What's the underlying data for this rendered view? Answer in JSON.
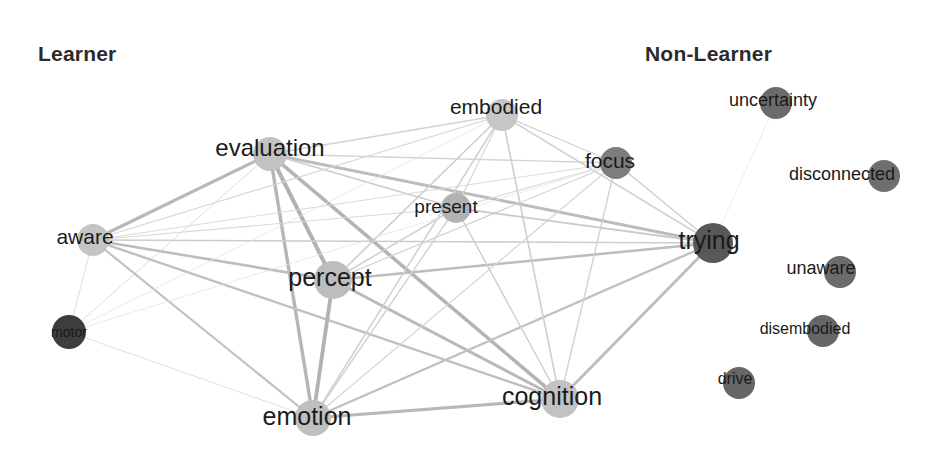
{
  "figure": {
    "type": "network-graph",
    "width": 936,
    "height": 454,
    "background": "#ffffff"
  },
  "groups": [
    {
      "id": "learner",
      "label": "Learner",
      "x": 38,
      "y": 42
    },
    {
      "id": "non-learner",
      "label": "Non-Learner",
      "x": 645,
      "y": 42
    }
  ],
  "colors": {
    "light_node": "#c9c9c9",
    "medium_node": "#a8a8a8",
    "dark_node": "#6e6e6e",
    "darkest_node": "#3d3d3d",
    "edge": "#b4b4b4",
    "edge_faint": "#d8d8d8",
    "label_text": "#1a1a1a",
    "title_text": "#2b2b2b"
  },
  "chart_data": {
    "type": "network",
    "title": "",
    "nodes": [
      {
        "id": "evaluation",
        "label": "evaluation",
        "group": "learner",
        "x": 270,
        "y": 154,
        "r": 17,
        "color": "#c2c2c2",
        "font_size": 24,
        "label_dx": 0,
        "label_dy": -6
      },
      {
        "id": "embodied",
        "label": "embodied",
        "group": "learner",
        "x": 502,
        "y": 115,
        "r": 16,
        "color": "#c6c6c6",
        "font_size": 21,
        "label_dx": -6,
        "label_dy": -9
      },
      {
        "id": "present",
        "label": "present",
        "group": "learner",
        "x": 456,
        "y": 208,
        "r": 15,
        "color": "#b2b2b2",
        "font_size": 19,
        "label_dx": -10,
        "label_dy": -2
      },
      {
        "id": "focus",
        "label": "focus",
        "group": "learner",
        "x": 616,
        "y": 163,
        "r": 16,
        "color": "#7d7d7d",
        "font_size": 21,
        "label_dx": -6,
        "label_dy": -3
      },
      {
        "id": "aware",
        "label": "aware",
        "group": "learner",
        "x": 93,
        "y": 240,
        "r": 16,
        "color": "#c4c4c4",
        "font_size": 21,
        "label_dx": -8,
        "label_dy": -4
      },
      {
        "id": "percept",
        "label": "percept",
        "group": "learner",
        "x": 333,
        "y": 280,
        "r": 19,
        "color": "#bdbdbd",
        "font_size": 25,
        "label_dx": -3,
        "label_dy": -3
      },
      {
        "id": "motor",
        "label": "motor",
        "group": "learner",
        "x": 69,
        "y": 332,
        "r": 17,
        "color": "#3d3d3d",
        "font_size": 14,
        "label_dx": 0,
        "label_dy": 0
      },
      {
        "id": "emotion",
        "label": "emotion",
        "group": "learner",
        "x": 313,
        "y": 418,
        "r": 18,
        "color": "#c0c0c0",
        "font_size": 25,
        "label_dx": -6,
        "label_dy": -2
      },
      {
        "id": "cognition",
        "label": "cognition",
        "group": "learner",
        "x": 560,
        "y": 399,
        "r": 19,
        "color": "#c2c2c2",
        "font_size": 25,
        "label_dx": -8,
        "label_dy": -3
      },
      {
        "id": "trying",
        "label": "trying",
        "group": "learner",
        "x": 713,
        "y": 243,
        "r": 20,
        "color": "#585858",
        "font_size": 25,
        "label_dx": -4,
        "label_dy": -3
      },
      {
        "id": "uncertainty",
        "label": "uncertainty",
        "group": "non-learner",
        "x": 776,
        "y": 103,
        "r": 16,
        "color": "#6b6b6b",
        "font_size": 18,
        "label_dx": -3,
        "label_dy": -3
      },
      {
        "id": "disconnected",
        "label": "disconnected",
        "group": "non-learner",
        "x": 884,
        "y": 176,
        "r": 16,
        "color": "#6e6e6e",
        "font_size": 18,
        "label_dx": -42,
        "label_dy": -2
      },
      {
        "id": "unaware",
        "label": "unaware",
        "group": "non-learner",
        "x": 840,
        "y": 272,
        "r": 16,
        "color": "#6b6b6b",
        "font_size": 18,
        "label_dx": -19,
        "label_dy": -4
      },
      {
        "id": "disembodied",
        "label": "disembodied",
        "group": "non-learner",
        "x": 823,
        "y": 331,
        "r": 16,
        "color": "#666666",
        "font_size": 16,
        "label_dx": -18,
        "label_dy": -2
      },
      {
        "id": "drive",
        "label": "drive",
        "group": "non-learner",
        "x": 739,
        "y": 383,
        "r": 16,
        "color": "#666666",
        "font_size": 16,
        "label_dx": -4,
        "label_dy": -4
      }
    ],
    "edges": [
      {
        "source": "evaluation",
        "target": "aware",
        "width": 3.2,
        "color": "#b8b8b8"
      },
      {
        "source": "evaluation",
        "target": "percept",
        "width": 4.0,
        "color": "#b2b2b2"
      },
      {
        "source": "evaluation",
        "target": "emotion",
        "width": 3.4,
        "color": "#b6b6b6"
      },
      {
        "source": "evaluation",
        "target": "cognition",
        "width": 3.6,
        "color": "#b4b4b4"
      },
      {
        "source": "evaluation",
        "target": "trying",
        "width": 3.0,
        "color": "#bcbcbc"
      },
      {
        "source": "evaluation",
        "target": "embodied",
        "width": 1.4,
        "color": "#d2d2d2"
      },
      {
        "source": "evaluation",
        "target": "present",
        "width": 1.6,
        "color": "#cccccc"
      },
      {
        "source": "evaluation",
        "target": "focus",
        "width": 1.3,
        "color": "#d4d4d4"
      },
      {
        "source": "evaluation",
        "target": "motor",
        "width": 1.0,
        "color": "#dcdcdc"
      },
      {
        "source": "aware",
        "target": "percept",
        "width": 2.6,
        "color": "#bdbdbd"
      },
      {
        "source": "aware",
        "target": "emotion",
        "width": 2.2,
        "color": "#c2c2c2"
      },
      {
        "source": "aware",
        "target": "cognition",
        "width": 2.4,
        "color": "#c0c0c0"
      },
      {
        "source": "aware",
        "target": "trying",
        "width": 1.6,
        "color": "#cccccc"
      },
      {
        "source": "aware",
        "target": "embodied",
        "width": 1.2,
        "color": "#d6d6d6"
      },
      {
        "source": "aware",
        "target": "present",
        "width": 1.1,
        "color": "#d8d8d8"
      },
      {
        "source": "aware",
        "target": "focus",
        "width": 1.0,
        "color": "#dadada"
      },
      {
        "source": "aware",
        "target": "motor",
        "width": 1.0,
        "color": "#dedede"
      },
      {
        "source": "percept",
        "target": "emotion",
        "width": 3.8,
        "color": "#b2b2b2"
      },
      {
        "source": "percept",
        "target": "cognition",
        "width": 3.0,
        "color": "#bababa"
      },
      {
        "source": "percept",
        "target": "trying",
        "width": 2.6,
        "color": "#bdbdbd"
      },
      {
        "source": "percept",
        "target": "embodied",
        "width": 1.6,
        "color": "#cfcfcf"
      },
      {
        "source": "percept",
        "target": "present",
        "width": 1.5,
        "color": "#d0d0d0"
      },
      {
        "source": "percept",
        "target": "focus",
        "width": 1.3,
        "color": "#d4d4d4"
      },
      {
        "source": "emotion",
        "target": "cognition",
        "width": 3.2,
        "color": "#b8b8b8"
      },
      {
        "source": "emotion",
        "target": "trying",
        "width": 2.4,
        "color": "#c0c0c0"
      },
      {
        "source": "emotion",
        "target": "embodied",
        "width": 1.5,
        "color": "#d0d0d0"
      },
      {
        "source": "emotion",
        "target": "present",
        "width": 1.4,
        "color": "#d2d2d2"
      },
      {
        "source": "emotion",
        "target": "focus",
        "width": 1.2,
        "color": "#d6d6d6"
      },
      {
        "source": "emotion",
        "target": "motor",
        "width": 1.0,
        "color": "#e0e0e0"
      },
      {
        "source": "cognition",
        "target": "trying",
        "width": 2.8,
        "color": "#bcbcbc"
      },
      {
        "source": "cognition",
        "target": "embodied",
        "width": 1.6,
        "color": "#cfcfcf"
      },
      {
        "source": "cognition",
        "target": "present",
        "width": 1.5,
        "color": "#d0d0d0"
      },
      {
        "source": "cognition",
        "target": "focus",
        "width": 1.4,
        "color": "#d2d2d2"
      },
      {
        "source": "trying",
        "target": "embodied",
        "width": 1.5,
        "color": "#d0d0d0"
      },
      {
        "source": "trying",
        "target": "present",
        "width": 1.8,
        "color": "#cacaca"
      },
      {
        "source": "trying",
        "target": "focus",
        "width": 1.6,
        "color": "#cecece"
      },
      {
        "source": "embodied",
        "target": "present",
        "width": 1.2,
        "color": "#d6d6d6"
      },
      {
        "source": "embodied",
        "target": "focus",
        "width": 1.3,
        "color": "#d4d4d4"
      },
      {
        "source": "present",
        "target": "focus",
        "width": 1.1,
        "color": "#dadada"
      },
      {
        "source": "focus",
        "target": "motor",
        "width": 0.8,
        "color": "#e4e4e4"
      },
      {
        "source": "trying",
        "target": "uncertainty",
        "width": 0.8,
        "color": "#e6e6e6"
      },
      {
        "source": "embodied",
        "target": "motor",
        "width": 0.8,
        "color": "#e4e4e4"
      }
    ],
    "legend": []
  }
}
